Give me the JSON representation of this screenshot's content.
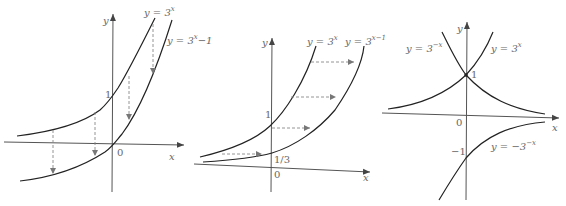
{
  "figures": [
    {
      "id": "shift-down",
      "axes": {
        "x_label": "x",
        "y_label": "y",
        "origin_label": "0",
        "tick_labels": [
          "1"
        ]
      },
      "curves": [
        {
          "name": "y = 3^x",
          "base": "y = 3",
          "exp": "x"
        },
        {
          "name": "y = 3^x - 1",
          "base": "y = 3",
          "exp": "x",
          "suffix": "−1"
        }
      ],
      "arrows": "vertical dashed arrows pointing down (translation by -1)"
    },
    {
      "id": "shift-right",
      "axes": {
        "x_label": "x",
        "y_label": "y",
        "origin_label": "0",
        "tick_labels": [
          "1",
          "1/3"
        ]
      },
      "curves": [
        {
          "name": "y = 3^x",
          "base": "y = 3",
          "exp": "x"
        },
        {
          "name": "y = 3^(x-1)",
          "base": "y = 3",
          "exp": "x−1"
        }
      ],
      "arrows": "horizontal dashed arrows pointing right (translation by +1)"
    },
    {
      "id": "reflections",
      "axes": {
        "x_label": "x",
        "y_label": "y",
        "origin_label": "0",
        "tick_labels": [
          "1",
          "−1"
        ]
      },
      "curves": [
        {
          "name": "y = 3^-x",
          "base": "y = 3",
          "exp": "−x"
        },
        {
          "name": "y = 3^x",
          "base": "y = 3",
          "exp": "x"
        },
        {
          "name": "y = -3^-x",
          "base": "y = −3",
          "exp": "−x"
        }
      ]
    }
  ]
}
